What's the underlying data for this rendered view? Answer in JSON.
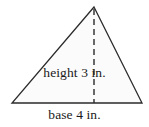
{
  "figure": {
    "kind": "geometry-diagram",
    "shape_name": "triangle",
    "background_color": "#ffffff",
    "stroke_color": "#2b2b2b",
    "fill_color": "#fbfbfb",
    "text_color": "#1a1a1a",
    "labels": {
      "height": "height 3 in.",
      "base": "base 4 in."
    },
    "measurements": {
      "height_value": "3",
      "height_unit": "in.",
      "base_value": "4",
      "base_unit": "in."
    },
    "geometry": {
      "apex": {
        "x": 94,
        "y": 7
      },
      "bottom_left": {
        "x": 12,
        "y": 103
      },
      "bottom_right": {
        "x": 142,
        "y": 103
      },
      "height_line": {
        "x": 94,
        "y1": 7,
        "y2": 103,
        "style": "dashed"
      },
      "stroke_width": 1.3,
      "dash_pattern": "6,4"
    }
  }
}
